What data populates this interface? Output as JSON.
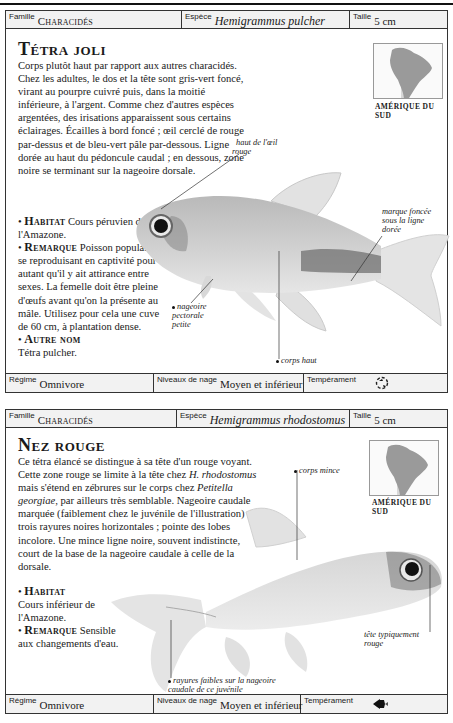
{
  "entries": [
    {
      "header": {
        "family_label": "Famille",
        "family_value": "Characidés",
        "species_label": "Espèce",
        "species_value": "Hemigrammus pulcher",
        "size_label": "Taille",
        "size_value": "5 cm"
      },
      "title": "Tétra joli",
      "description": "Corps plutôt haut par rapport aux autres characidés. Chez les adultes, le dos et la tête sont gris-vert foncé, virant au pourpre cuivré puis, dans la moitié inférieure, à l'argent. Comme chez d'autres espèces argentées, des irisations apparaissent sous certains éclairages. Écailles à bord foncé ; œil cerclé de rouge par-dessus et de bleu-vert pâle par-dessous. Ligne dorée au haut du pédoncule caudal ; en dessous, zone noire se terminant sur la nageoire dorsale.",
      "habitat_label": "Habitat",
      "habitat_text": "Cours péruvien de l'Amazone.",
      "remark_label": "Remarque",
      "remark_text": "Poisson populaire, se reproduisant en captivité pour autant qu'il y ait attirance entre sexes. La femelle doit être pleine d'œufs avant qu'on la présente au mâle. Utilisez pour cela une cuve de 60 cm, à plantation dense.",
      "other_name_label": "Autre nom",
      "other_name_text": "Tétra pulcher.",
      "map_caption": "AMÉRIQUE DU SUD",
      "callouts": {
        "eye": "haut de l'œil rouge",
        "mark": "marque foncée sous la ligne dorée",
        "pectoral": "nageoire pectorale petite",
        "body": "corps haut"
      },
      "footer": {
        "diet_label": "Régime",
        "diet_value": "Omnivore",
        "swim_label": "Niveaux de nage",
        "swim_value": "Moyen et inférieur",
        "temperament_label": "Tempérament",
        "temperament_icon": "community-fish-icon"
      }
    },
    {
      "header": {
        "family_label": "Famille",
        "family_value": "Characidés",
        "species_label": "Espèce",
        "species_value": "Hemigrammus rhodostomus",
        "size_label": "Taille",
        "size_value": "5 cm"
      },
      "title": "Nez rouge",
      "description_parts": {
        "p1": "Ce tétra élancé se distingue à sa tête d'un rouge voyant. Cette zone rouge se limite à la tête chez ",
        "italic1": "H. rhodostomus",
        "p2": " mais s'étend en zébrures sur le corps chez ",
        "italic2": "Petitella georgiae",
        "p3": ", par ailleurs très semblable. Nageoire caudale marquée (faiblement chez le juvénile de l'illustration) de trois rayures noires horizontales ; pointe des lobes incolore. Une mince ligne noire, souvent indistincte, court de la base de la nageoire caudale à celle de la dorsale."
      },
      "habitat_label": "Habitat",
      "habitat_text": "Cours inférieur de l'Amazone.",
      "remark_label": "Remarque",
      "remark_text": "Sensible aux changements d'eau.",
      "map_caption": "AMÉRIQUE DU SUD",
      "callouts": {
        "body": "corps mince",
        "head": "tête typiquement rouge",
        "stripes": "rayures faibles sur la nageoire caudale de ce juvénile"
      },
      "footer": {
        "diet_label": "Régime",
        "diet_value": "Omnivore",
        "swim_label": "Niveaux de nage",
        "swim_value": "Moyen et inférieur",
        "temperament_label": "Tempérament",
        "temperament_icon": "shoaling-fish-icon"
      }
    }
  ]
}
